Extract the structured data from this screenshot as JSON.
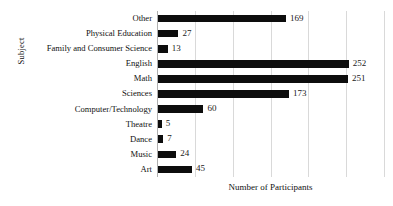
{
  "chart_data": {
    "type": "bar",
    "orientation": "horizontal",
    "title": "",
    "xlabel": "Number of Participants",
    "ylabel": "Subject",
    "categories": [
      "Art",
      "Music",
      "Dance",
      "Theatre",
      "Computer/Technology",
      "Sciences",
      "Math",
      "English",
      "Family and Consumer Science",
      "Physical Education",
      "Other"
    ],
    "values": [
      45,
      24,
      7,
      5,
      60,
      173,
      251,
      252,
      13,
      27,
      169
    ],
    "data_labels": [
      "45",
      "24",
      "7",
      "5",
      "60",
      "173",
      "251",
      "252",
      "13",
      "27",
      "169"
    ],
    "xlim": [
      0,
      300
    ],
    "gridlines": [
      50,
      100,
      150,
      200,
      250,
      300
    ],
    "xticklabels": [],
    "grid": true,
    "legend": false,
    "bar_color": "#0d0d0d",
    "gridline_color": "#d9d9d9",
    "background_color": "#ffffff"
  }
}
